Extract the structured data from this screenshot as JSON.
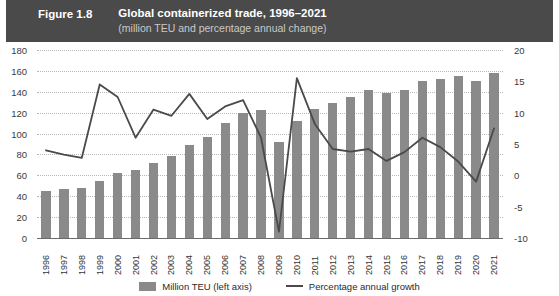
{
  "header": {
    "figure_label": "Figure 1.8",
    "title": "Global containerized trade, 1996–2021",
    "subtitle": "(million TEU and percentage annual change)",
    "bar_color": "#8a8a8a",
    "line_color": "#4a4a4a",
    "header_bg": "#4a4a4a"
  },
  "legend": {
    "items": [
      {
        "label": "Million TEU (left axis)",
        "marker": "bar-swatch"
      },
      {
        "label": "Percentage annual growth",
        "marker": "line-swatch"
      }
    ]
  },
  "chart_data": {
    "type": "bar",
    "title": "Global containerized trade, 1996–2021",
    "subtitle": "(million TEU and percentage annual change)",
    "xlabel": "",
    "ylabel": "",
    "grid": true,
    "legend_position": "bottom",
    "categories": [
      "1996",
      "1997",
      "1998",
      "1999",
      "2000",
      "2001",
      "2002",
      "2003",
      "2004",
      "2005",
      "2006",
      "2007",
      "2008",
      "2009",
      "2010",
      "2011",
      "2012",
      "2013",
      "2014",
      "2015",
      "2016",
      "2017",
      "2018",
      "2019",
      "2020",
      "2021"
    ],
    "axes": {
      "left": {
        "label": "Million TEU",
        "min": 0,
        "max": 180,
        "step": 20,
        "ticks": [
          0,
          20,
          40,
          60,
          80,
          100,
          120,
          140,
          160,
          180
        ]
      },
      "right": {
        "label": "Percentage annual growth",
        "min": -10,
        "max": 20,
        "step": 5,
        "ticks": [
          -10,
          -5,
          0,
          5,
          10,
          15,
          20
        ]
      }
    },
    "series": [
      {
        "name": "Million TEU (left axis)",
        "type": "bar",
        "axis": "left",
        "unit": "million TEU",
        "values": [
          45,
          47,
          48,
          55,
          62,
          65,
          72,
          79,
          89,
          97,
          110,
          120,
          123,
          92,
          112,
          124,
          129,
          135,
          142,
          139,
          142,
          150,
          152,
          155,
          150,
          158
        ]
      },
      {
        "name": "Percentage annual growth",
        "type": "line",
        "axis": "right",
        "unit": "percent",
        "values": [
          4.0,
          3.3,
          2.8,
          14.5,
          12.5,
          6.0,
          10.5,
          9.5,
          13.0,
          9.0,
          11.0,
          12.0,
          6.0,
          -9.0,
          15.5,
          8.2,
          4.2,
          3.8,
          4.2,
          2.3,
          3.7,
          6.0,
          4.5,
          2.2,
          -1.0,
          7.5
        ]
      }
    ]
  }
}
